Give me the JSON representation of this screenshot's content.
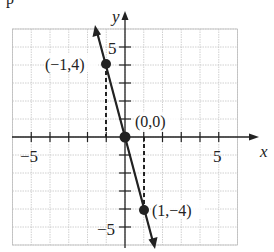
{
  "header_fragment": "p... (  ,  )",
  "chart_data": {
    "type": "line",
    "title": "",
    "xlabel": "x",
    "ylabel": "y",
    "xlim": [
      -6,
      6
    ],
    "ylim": [
      -6,
      6
    ],
    "grid": true,
    "x_tick_labels": [
      "-5",
      "5"
    ],
    "y_tick_labels": [
      "5",
      "-5"
    ],
    "series": [
      {
        "name": "y = -4x",
        "equation": "y = -4x",
        "points": [
          {
            "x": -1,
            "y": 4,
            "label": "(−1,4)"
          },
          {
            "x": 0,
            "y": 0,
            "label": "(0,0)"
          },
          {
            "x": 1,
            "y": -4,
            "label": "(1,−4)"
          }
        ]
      }
    ],
    "annotations": [
      "dashed vertical line from (-1,0) to (-1,4)",
      "dashed vertical line from (1,0) to (1,-4)"
    ]
  },
  "labels": {
    "x_axis": "x",
    "y_axis": "y",
    "tick_x_neg5": "−5",
    "tick_x_pos5": "5",
    "tick_y_pos5": "5",
    "tick_y_neg5": "−5",
    "pt_a": "(−1,4)",
    "pt_o": "(0,0)",
    "pt_b": "(1,−4)"
  },
  "colors": {
    "ink": "#222222",
    "grid": "#bdbdbd"
  }
}
